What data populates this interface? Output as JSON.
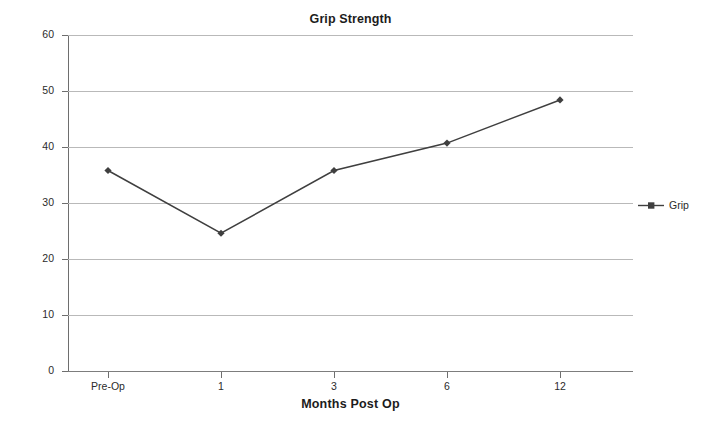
{
  "chart_data": {
    "type": "line",
    "title": "Grip Strength",
    "xlabel": "Months Post Op",
    "ylabel": "Function",
    "categories": [
      "Pre-Op",
      "1",
      "3",
      "6",
      "12"
    ],
    "series": [
      {
        "name": "Grip",
        "values": [
          35.8,
          24.6,
          35.8,
          40.7,
          48.4
        ],
        "color": "#3f3f3f",
        "marker": "diamond"
      }
    ],
    "ylim": [
      0,
      60
    ],
    "yticks": [
      0,
      10,
      20,
      30,
      40,
      50,
      60
    ],
    "ytick_labels": [
      "0",
      "10",
      "20",
      "30",
      "40",
      "50",
      "60"
    ],
    "grid": true,
    "legend_position": "right",
    "grid_color": "#b9b9b9",
    "axis_color": "#6e6e6e",
    "text_color": "#231f20"
  },
  "legend": {
    "entries": [
      {
        "label": "Grip",
        "color": "#3f3f3f"
      }
    ]
  }
}
